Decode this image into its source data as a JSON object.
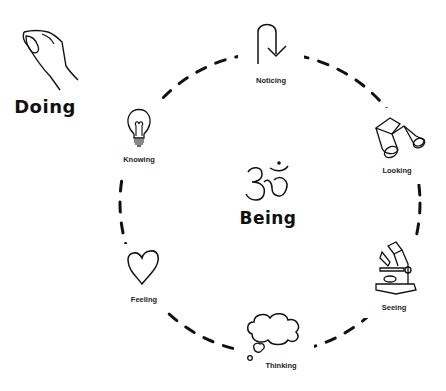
{
  "diagram": {
    "outer": {
      "label": "Doing",
      "icon": "hand-icon"
    },
    "center": {
      "label": "Being",
      "icon": "om-symbol-icon"
    },
    "cycle": [
      {
        "label": "Noticing",
        "icon": "u-turn-arrow-icon"
      },
      {
        "label": "Looking",
        "icon": "binoculars-icon"
      },
      {
        "label": "Seeing",
        "icon": "microscope-icon"
      },
      {
        "label": "Thinking",
        "icon": "thought-cloud-icon"
      },
      {
        "label": "Feeling",
        "icon": "heart-icon"
      },
      {
        "label": "Knowing",
        "icon": "lightbulb-icon"
      }
    ],
    "ring_style": "dashed circle",
    "colors": {
      "stroke": "#111111",
      "background": "#ffffff",
      "text": "#222222"
    }
  }
}
